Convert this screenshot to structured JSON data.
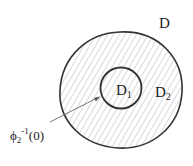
{
  "diagram": {
    "labels": {
      "outer": "D",
      "inner": "D",
      "inner_sub": "1",
      "ring": "D",
      "ring_sub": "2",
      "pointer_phi": "ϕ",
      "pointer_sub": "2",
      "pointer_sup": "-1",
      "pointer_arg": "(0)"
    },
    "colors": {
      "stroke": "#333333",
      "hatch": "#9a9a9a",
      "background": "#ffffff"
    }
  }
}
